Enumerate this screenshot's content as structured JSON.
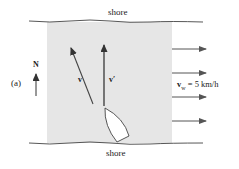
{
  "diagram": {
    "top_label": "shore",
    "bottom_label": "shore",
    "panel_label": "(a)",
    "north_label": "N",
    "vector_v": "v",
    "vector_v_prime": "v′",
    "water_velocity_symbol": "v",
    "water_velocity_subscript": "w",
    "water_velocity_value": " = 5 km/h",
    "colors": {
      "water": "#e6e6e6",
      "ink": "#333333"
    }
  }
}
